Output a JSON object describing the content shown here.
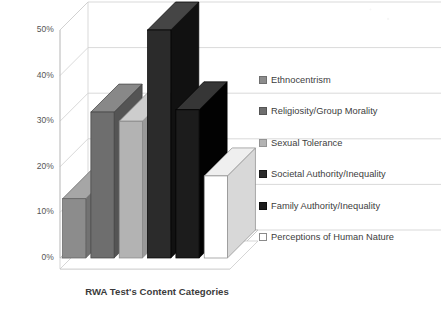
{
  "chart_data": {
    "type": "bar",
    "title": "RWA Test's Content Categories",
    "xlabel": "RWA Test's Content Categories",
    "ylabel": "",
    "ylim": [
      0,
      50
    ],
    "grid": true,
    "legend_position": "right",
    "style": "3d-column",
    "categories": [
      "Ethnocentrism",
      "Religiosity/Group Morality",
      "Sexual Tolerance",
      "Societal Authority/Inequality",
      "Family Authority/Inequality",
      "Perceptions of Human Nature"
    ],
    "values": [
      13,
      32,
      30,
      50,
      32.5,
      18
    ],
    "value_labels": [
      "13%",
      "32%",
      "30%",
      "50%",
      "32.5%",
      "18%"
    ],
    "colors": [
      "#8c8c8c",
      "#6e6e6e",
      "#b3b3b3",
      "#2b2b2b",
      "#1c1c1c",
      "#ffffff"
    ],
    "tick_labels": [
      "0%",
      "10%",
      "20%",
      "30%",
      "40%",
      "50%"
    ],
    "tick_values": [
      0,
      10,
      20,
      30,
      40,
      50
    ]
  },
  "title": {
    "text": "RWA Test's Content Categories"
  },
  "axis": {
    "ticks": [
      {
        "label": "50%",
        "value": 50
      },
      {
        "label": "40%",
        "value": 40
      },
      {
        "label": "30%",
        "value": 30
      },
      {
        "label": "20%",
        "value": 20
      },
      {
        "label": "10%",
        "value": 10
      },
      {
        "label": "0%",
        "value": 0
      }
    ]
  },
  "legend": {
    "items": [
      {
        "label": "Ethnocentrism",
        "color": "#8c8c8c",
        "border": "#6f6f6f"
      },
      {
        "label": "Religiosity/Group Morality",
        "color": "#6e6e6e",
        "border": "#555555"
      },
      {
        "label": "Sexual Tolerance",
        "color": "#b3b3b3",
        "border": "#949494"
      },
      {
        "label": "Societal Authority/Inequality",
        "color": "#2b2b2b",
        "border": "#1a1a1a"
      },
      {
        "label": "Family Authority/Inequality",
        "color": "#1c1c1c",
        "border": "#0f0f0f"
      },
      {
        "label": "Perceptions of Human Nature",
        "color": "#ffffff",
        "border": "#8a8a8a"
      }
    ]
  }
}
